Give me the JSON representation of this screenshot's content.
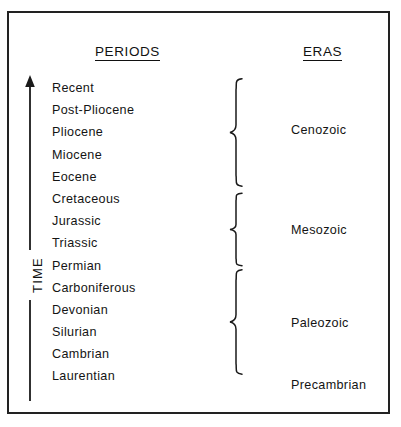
{
  "figure": {
    "headers": {
      "periods": "PERIODS",
      "eras": "ERAS"
    },
    "time_axis": {
      "label": "TIME",
      "direction": "up",
      "arrow_icon": "arrow-up-icon"
    },
    "periods": [
      "Recent",
      "Post-Pliocene",
      "Pliocene",
      "Miocene",
      "Eocene",
      "Cretaceous",
      "Jurassic",
      "Triassic",
      "Permian",
      "Carboniferous",
      "Devonian",
      "Silurian",
      "Cambrian",
      "Laurentian"
    ],
    "eras": [
      {
        "name": "Cenozoic",
        "top": 123,
        "brace_top": 77,
        "brace_height": 111,
        "has_brace": true
      },
      {
        "name": "Mesozoic",
        "top": 223,
        "brace_top": 192,
        "brace_height": 75,
        "has_brace": true
      },
      {
        "name": "Paleozoic",
        "top": 316,
        "brace_top": 268,
        "brace_height": 108,
        "has_brace": true
      },
      {
        "name": "Precambrian",
        "top": 378,
        "brace_top": 0,
        "brace_height": 0,
        "has_brace": false
      }
    ],
    "colors": {
      "ink": "#141414",
      "frame": "#222222",
      "background": "#ffffff"
    }
  },
  "chart_data": {
    "type": "table",
    "columns": [
      "PERIODS",
      "ERAS"
    ],
    "axis": {
      "label": "TIME",
      "orientation": "vertical",
      "arrow": "up",
      "meaning": "older at bottom, more recent at top"
    },
    "rows": [
      {
        "period": "Recent",
        "era": "Cenozoic"
      },
      {
        "period": "Post-Pliocene",
        "era": "Cenozoic"
      },
      {
        "period": "Pliocene",
        "era": "Cenozoic"
      },
      {
        "period": "Miocene",
        "era": "Cenozoic"
      },
      {
        "period": "Eocene",
        "era": "Cenozoic"
      },
      {
        "period": "Cretaceous",
        "era": "Mesozoic"
      },
      {
        "period": "Jurassic",
        "era": "Mesozoic"
      },
      {
        "period": "Triassic",
        "era": "Mesozoic"
      },
      {
        "period": "Permian",
        "era": "Paleozoic"
      },
      {
        "period": "Carboniferous",
        "era": "Paleozoic"
      },
      {
        "period": "Devonian",
        "era": "Paleozoic"
      },
      {
        "period": "Silurian",
        "era": "Paleozoic"
      },
      {
        "period": "Cambrian",
        "era": "Paleozoic"
      },
      {
        "period": "Laurentian",
        "era": "Precambrian"
      }
    ],
    "era_groups": [
      {
        "name": "Cenozoic",
        "periods": [
          "Recent",
          "Post-Pliocene",
          "Pliocene",
          "Miocene",
          "Eocene"
        ]
      },
      {
        "name": "Mesozoic",
        "periods": [
          "Cretaceous",
          "Jurassic",
          "Triassic"
        ]
      },
      {
        "name": "Paleozoic",
        "periods": [
          "Permian",
          "Carboniferous",
          "Devonian",
          "Silurian",
          "Cambrian"
        ]
      },
      {
        "name": "Precambrian",
        "periods": [
          "Laurentian"
        ]
      }
    ]
  }
}
